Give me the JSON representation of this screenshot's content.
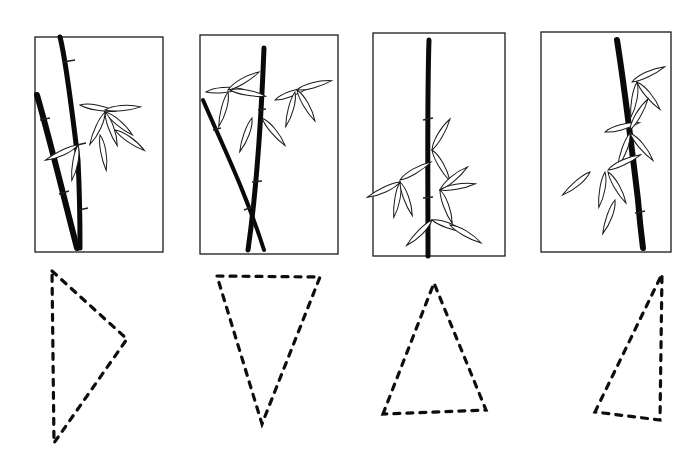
{
  "figure": {
    "colors": {
      "ink": "#0a0a0a",
      "paper": "#ffffff"
    },
    "panels": [
      {
        "id": 1,
        "frame": [
          35,
          37,
          128,
          215
        ],
        "triangle": [
          [
            52,
            271
          ],
          [
            127,
            339
          ],
          [
            54,
            443
          ]
        ]
      },
      {
        "id": 2,
        "frame": [
          200,
          35,
          138,
          219
        ],
        "triangle": [
          [
            217,
            276
          ],
          [
            320,
            277
          ],
          [
            262,
            424
          ]
        ]
      },
      {
        "id": 3,
        "frame": [
          373,
          33,
          132,
          223
        ],
        "triangle": [
          [
            383,
            414
          ],
          [
            434,
            283
          ],
          [
            486,
            410
          ]
        ]
      },
      {
        "id": 4,
        "frame": [
          541,
          32,
          130,
          220
        ],
        "triangle": [
          [
            595,
            412
          ],
          [
            662,
            274
          ],
          [
            660,
            420
          ]
        ]
      }
    ]
  }
}
